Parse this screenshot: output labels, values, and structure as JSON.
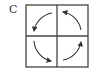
{
  "figure": {
    "label": "C",
    "grid": {
      "rows": 2,
      "cols": 2
    },
    "arrows": [
      {
        "quadrant": "top-left",
        "direction": "down-left",
        "rotation": "counterclockwise"
      },
      {
        "quadrant": "bottom-left",
        "direction": "right",
        "rotation": "counterclockwise"
      },
      {
        "quadrant": "bottom-right",
        "direction": "up",
        "rotation": "counterclockwise"
      },
      {
        "quadrant": "top-right",
        "direction": "left",
        "rotation": "counterclockwise"
      }
    ],
    "colors": {
      "line": "#444444",
      "arrow": "#333333"
    }
  }
}
